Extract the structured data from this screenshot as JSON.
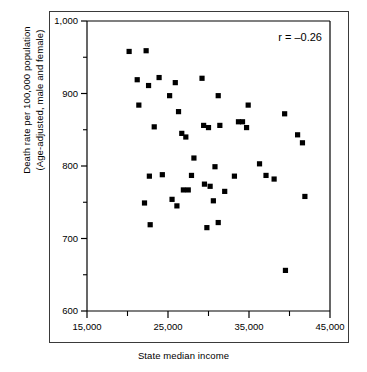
{
  "figure": {
    "x_axis_title": "State median income",
    "y_axis_title_line1": "Death rate per 100,000 population",
    "y_axis_title_line2": "(Age-adjusted, male and female)",
    "annotation": "r = –0.26"
  },
  "chart_data": {
    "type": "scatter",
    "title": "",
    "xlabel": "State median income",
    "ylabel": "Death rate per 100,000 population (Age-adjusted, male and female)",
    "annotations": [
      "r = –0.26"
    ],
    "correlation": -0.26,
    "grid": false,
    "legend": null,
    "xlim": [
      15000,
      45000
    ],
    "ylim": [
      600,
      1000
    ],
    "xticks": [
      15000,
      25000,
      35000,
      45000
    ],
    "xtick_labels": [
      "15,000",
      "25,000",
      "35,000",
      "45,000"
    ],
    "xminor_ticks": [
      20000,
      30000,
      40000
    ],
    "yticks": [
      600,
      700,
      800,
      900,
      1000
    ],
    "ytick_labels": [
      "600",
      "700",
      "800",
      "900",
      "1,000"
    ],
    "yminor_ticks": [
      650,
      750,
      850,
      950
    ],
    "marker": "square",
    "marker_color": "#000000",
    "points": [
      {
        "x": 20200,
        "y": 958
      },
      {
        "x": 22300,
        "y": 959
      },
      {
        "x": 21200,
        "y": 919
      },
      {
        "x": 23900,
        "y": 922
      },
      {
        "x": 22600,
        "y": 911
      },
      {
        "x": 25900,
        "y": 915
      },
      {
        "x": 29200,
        "y": 921
      },
      {
        "x": 25200,
        "y": 897
      },
      {
        "x": 31200,
        "y": 897
      },
      {
        "x": 21400,
        "y": 884
      },
      {
        "x": 34900,
        "y": 884
      },
      {
        "x": 39400,
        "y": 872
      },
      {
        "x": 26300,
        "y": 875
      },
      {
        "x": 23300,
        "y": 854
      },
      {
        "x": 29400,
        "y": 856
      },
      {
        "x": 30000,
        "y": 853
      },
      {
        "x": 31400,
        "y": 856
      },
      {
        "x": 33700,
        "y": 861
      },
      {
        "x": 34200,
        "y": 861
      },
      {
        "x": 34700,
        "y": 853
      },
      {
        "x": 26700,
        "y": 845
      },
      {
        "x": 27200,
        "y": 840
      },
      {
        "x": 41000,
        "y": 843
      },
      {
        "x": 41600,
        "y": 832
      },
      {
        "x": 28200,
        "y": 811
      },
      {
        "x": 36300,
        "y": 803
      },
      {
        "x": 30800,
        "y": 799
      },
      {
        "x": 22700,
        "y": 786
      },
      {
        "x": 24300,
        "y": 788
      },
      {
        "x": 27900,
        "y": 787
      },
      {
        "x": 33200,
        "y": 786
      },
      {
        "x": 37100,
        "y": 787
      },
      {
        "x": 38100,
        "y": 782
      },
      {
        "x": 30200,
        "y": 772
      },
      {
        "x": 29500,
        "y": 775
      },
      {
        "x": 26900,
        "y": 767
      },
      {
        "x": 27500,
        "y": 767
      },
      {
        "x": 32000,
        "y": 765
      },
      {
        "x": 41900,
        "y": 758
      },
      {
        "x": 25500,
        "y": 754
      },
      {
        "x": 30600,
        "y": 752
      },
      {
        "x": 22100,
        "y": 749
      },
      {
        "x": 26100,
        "y": 745
      },
      {
        "x": 31200,
        "y": 722
      },
      {
        "x": 22800,
        "y": 719
      },
      {
        "x": 29800,
        "y": 715
      },
      {
        "x": 39500,
        "y": 656
      }
    ]
  }
}
